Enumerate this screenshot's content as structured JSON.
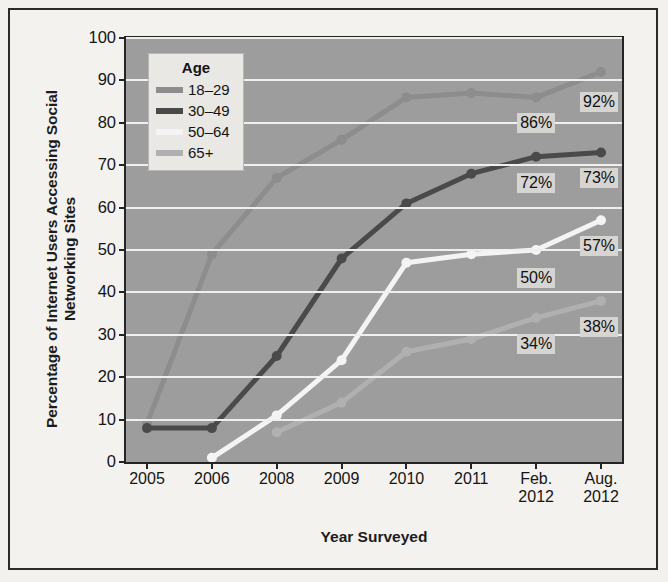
{
  "chart_data": {
    "type": "line",
    "title": "",
    "xlabel": "Year Surveyed",
    "ylabel": "Percentage of Internet Users Accessing Social Networking Sites",
    "categories": [
      "2005",
      "2006",
      "2008",
      "2009",
      "2010",
      "2011",
      "Feb. 2012",
      "Aug. 2012"
    ],
    "x_tick_lines": [
      [
        "2005"
      ],
      [
        "2006"
      ],
      [
        "2008"
      ],
      [
        "2009"
      ],
      [
        "2010"
      ],
      [
        "2011"
      ],
      [
        "Feb.",
        "2012"
      ],
      [
        "Aug.",
        "2012"
      ]
    ],
    "ylim": [
      0,
      100
    ],
    "yticks": [
      0,
      10,
      20,
      30,
      40,
      50,
      60,
      70,
      80,
      90,
      100
    ],
    "grid": true,
    "legend_title": "Age",
    "legend_position": "top-left inside plot",
    "series": [
      {
        "name": "18-29",
        "color": "#8d8d8d",
        "values": [
          9,
          49,
          67,
          76,
          86,
          87,
          86,
          92
        ]
      },
      {
        "name": "30-49",
        "color": "#4a4a4a",
        "values": [
          8,
          8,
          25,
          48,
          61,
          68,
          72,
          73
        ]
      },
      {
        "name": "50-64",
        "color": "#f4f4f4",
        "values": [
          null,
          1,
          11,
          24,
          47,
          49,
          50,
          57
        ]
      },
      {
        "name": "65+",
        "color": "#b0b0b0",
        "values": [
          null,
          null,
          7,
          14,
          26,
          29,
          34,
          38
        ]
      }
    ],
    "annotations": [
      {
        "text": "86%",
        "series": "18-29",
        "category": "Feb. 2012",
        "value": 86
      },
      {
        "text": "92%",
        "series": "18-29",
        "category": "Aug. 2012",
        "value": 92
      },
      {
        "text": "72%",
        "series": "30-49",
        "category": "Feb. 2012",
        "value": 72
      },
      {
        "text": "73%",
        "series": "30-49",
        "category": "Aug. 2012",
        "value": 73
      },
      {
        "text": "50%",
        "series": "50-64",
        "category": "Feb. 2012",
        "value": 50
      },
      {
        "text": "57%",
        "series": "50-64",
        "category": "Aug. 2012",
        "value": 57
      },
      {
        "text": "34%",
        "series": "65+",
        "category": "Feb. 2012",
        "value": 34
      },
      {
        "text": "38%",
        "series": "65+",
        "category": "Aug. 2012",
        "value": 38
      }
    ],
    "colors": {
      "plot_background": "#9d9d9d",
      "gridline": "#efefef",
      "axis": "#242424",
      "page_background": "#f3f2ee",
      "label_background": "#d6d5d1"
    }
  }
}
